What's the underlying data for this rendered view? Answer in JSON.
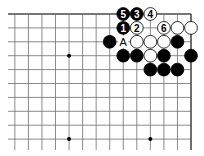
{
  "diagram": {
    "type": "go-board-fragment",
    "corner": "top-right",
    "visible_columns": 14,
    "visible_rows": 10,
    "colors": {
      "line": "#6e6e6e",
      "edge": "#4a4a4a",
      "black_stone": "#000000",
      "white_stone": "#ffffff",
      "stone_outline": "#000000",
      "star": "#000000"
    },
    "star_points": [
      {
        "col": 10,
        "row": 4
      },
      {
        "col": 10,
        "row": 10
      },
      {
        "col": 4,
        "row": 10
      }
    ],
    "stones": [
      {
        "color": "black",
        "col": 6,
        "row": 1,
        "label": "5"
      },
      {
        "color": "black",
        "col": 5,
        "row": 1,
        "label": "3"
      },
      {
        "color": "white",
        "col": 4,
        "row": 1,
        "label": "4"
      },
      {
        "color": "black",
        "col": 6,
        "row": 2,
        "label": "1"
      },
      {
        "color": "white",
        "col": 5,
        "row": 2,
        "label": "2"
      },
      {
        "color": "white",
        "col": 3,
        "row": 2,
        "label": "6"
      },
      {
        "color": "white",
        "col": 2,
        "row": 2,
        "label": ""
      },
      {
        "color": "white",
        "col": 1,
        "row": 2,
        "label": ""
      },
      {
        "color": "black",
        "col": 7,
        "row": 3,
        "label": ""
      },
      {
        "color": "white",
        "col": 5,
        "row": 3,
        "label": ""
      },
      {
        "color": "white",
        "col": 4,
        "row": 3,
        "label": ""
      },
      {
        "color": "white",
        "col": 3,
        "row": 3,
        "label": ""
      },
      {
        "color": "black",
        "col": 2,
        "row": 3,
        "label": ""
      },
      {
        "color": "black",
        "col": 6,
        "row": 4,
        "label": ""
      },
      {
        "color": "black",
        "col": 5,
        "row": 4,
        "label": ""
      },
      {
        "color": "white",
        "col": 4,
        "row": 4,
        "label": ""
      },
      {
        "color": "black",
        "col": 3,
        "row": 4,
        "label": ""
      },
      {
        "color": "black",
        "col": 1,
        "row": 4,
        "label": ""
      },
      {
        "color": "black",
        "col": 4,
        "row": 5,
        "label": ""
      },
      {
        "color": "black",
        "col": 3,
        "row": 5,
        "label": ""
      },
      {
        "color": "black",
        "col": 2,
        "row": 5,
        "label": ""
      }
    ],
    "point_labels": [
      {
        "col": 6,
        "row": 3,
        "text": "A"
      }
    ]
  }
}
